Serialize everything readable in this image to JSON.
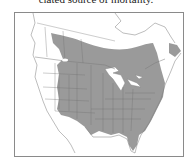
{
  "caption": {
    "text": "ciated source of mortality."
  },
  "map": {
    "region": "North America",
    "description": "Species range map",
    "colors": {
      "range_fill": "#9a9a9a",
      "land": "#ffffff",
      "borders": "#7a7a7a",
      "frame": "#8a8a8a"
    }
  }
}
